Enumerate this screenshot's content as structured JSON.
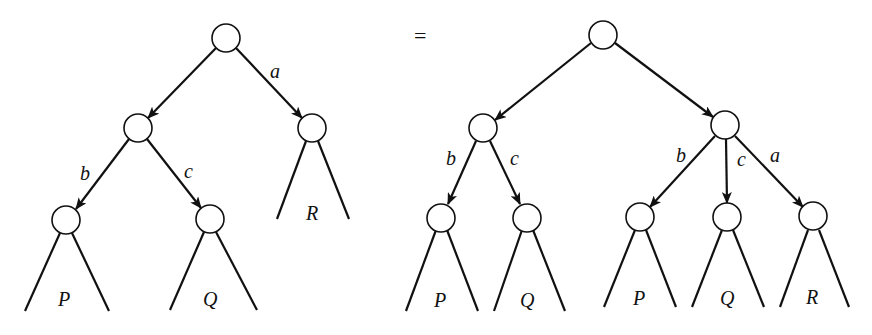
{
  "diagram": {
    "equals_sign": "=",
    "left_tree": {
      "nodes": [
        {
          "id": "root",
          "x": 226,
          "y": 38
        },
        {
          "id": "n1",
          "x": 138,
          "y": 128
        },
        {
          "id": "n2",
          "x": 312,
          "y": 128
        },
        {
          "id": "p",
          "x": 66,
          "y": 220
        },
        {
          "id": "q",
          "x": 210,
          "y": 219
        }
      ],
      "edges": [
        {
          "from": "root",
          "to": "n1",
          "label": ""
        },
        {
          "from": "root",
          "to": "n2",
          "label": "a"
        },
        {
          "from": "n1",
          "to": "p",
          "label": "b"
        },
        {
          "from": "n1",
          "to": "q",
          "label": "c"
        }
      ],
      "edge_labels": {
        "a": "a",
        "b": "b",
        "c": "c"
      },
      "subtree_labels": {
        "p": "P",
        "q": "Q",
        "r": "R"
      }
    },
    "right_tree": {
      "nodes": [
        {
          "id": "root",
          "x": 603,
          "y": 35
        },
        {
          "id": "n1",
          "x": 483,
          "y": 128
        },
        {
          "id": "n2",
          "x": 725,
          "y": 125
        },
        {
          "id": "p1",
          "x": 441,
          "y": 217
        },
        {
          "id": "q1",
          "x": 527,
          "y": 217
        },
        {
          "id": "p2",
          "x": 640,
          "y": 217
        },
        {
          "id": "q2",
          "x": 727,
          "y": 217
        },
        {
          "id": "r2",
          "x": 813,
          "y": 217
        }
      ],
      "edges": [
        {
          "from": "root",
          "to": "n1",
          "label": ""
        },
        {
          "from": "root",
          "to": "n2",
          "label": ""
        },
        {
          "from": "n1",
          "to": "p1",
          "label": "b"
        },
        {
          "from": "n1",
          "to": "q1",
          "label": "c"
        },
        {
          "from": "n2",
          "to": "p2",
          "label": "b"
        },
        {
          "from": "n2",
          "to": "q2",
          "label": "c"
        },
        {
          "from": "n2",
          "to": "r2",
          "label": "a"
        }
      ],
      "edge_labels": {
        "b1": "b",
        "c1": "c",
        "b2": "b",
        "c2": "c",
        "a2": "a"
      },
      "subtree_labels": {
        "p1": "P",
        "q1": "Q",
        "p2": "P",
        "q2": "Q",
        "r2": "R"
      }
    }
  }
}
